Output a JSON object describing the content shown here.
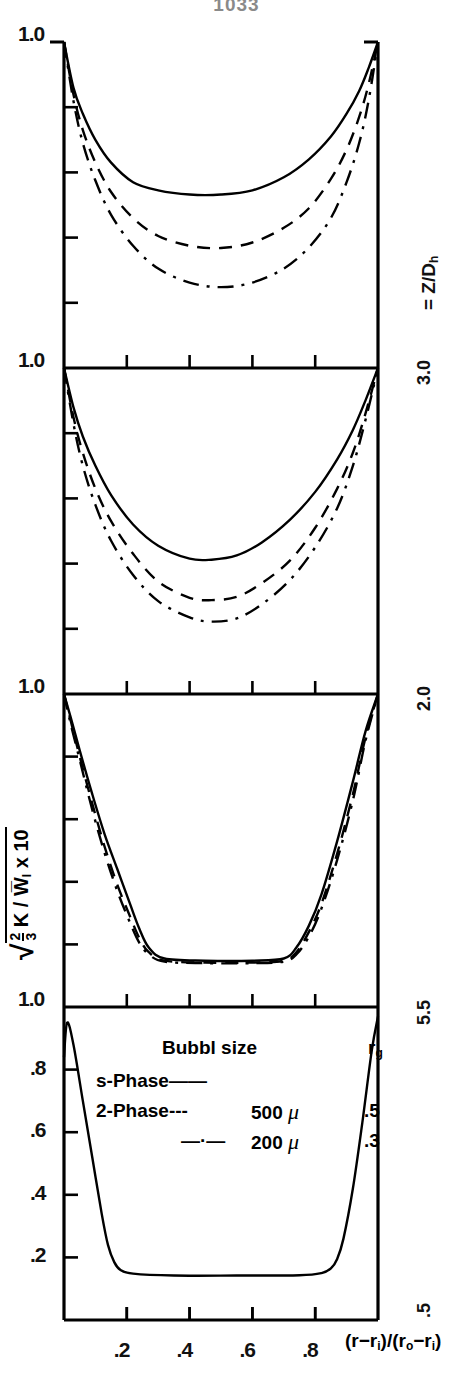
{
  "page_number": "1033",
  "axes": {
    "y_title_parts": {
      "radical": "√",
      "frac_num": "2",
      "frac_den": "3",
      "body": "K / W",
      "body_sub": "l",
      "tail": " x 10"
    },
    "y_title_plain": "√(2/3 K / W̄_l) x 10",
    "x_title": "(r−r_i)/(r_o−r_i)",
    "x_ticks": [
      ".2",
      ".4",
      ".6",
      ".8"
    ],
    "x_tick_values": [
      0.2,
      0.4,
      0.6,
      0.8
    ],
    "y_top_label": "1.0",
    "y_ticks_bottom_panel": [
      ".2",
      ".4",
      ".6",
      ".8",
      "1.0"
    ],
    "y_tick_values_bottom_panel": [
      0.2,
      0.4,
      0.6,
      0.8,
      1.0
    ],
    "xlim": [
      0,
      1
    ],
    "ylim": [
      0,
      1
    ],
    "grid": false
  },
  "panel_side_label": "= Z/D",
  "panel_side_label_sub": "h",
  "panels": [
    {
      "id": "panel-1",
      "z_over_dh": "3.0",
      "label": "3.0"
    },
    {
      "id": "panel-2",
      "z_over_dh": "2.0",
      "label": "2.0"
    },
    {
      "id": "panel-3",
      "z_over_dh": "5.5",
      "label": "5.5"
    },
    {
      "id": "panel-4",
      "z_over_dh": ".5",
      "label": ".5"
    }
  ],
  "legend": {
    "header_center": "Bubbl size",
    "header_right": "r",
    "header_right_sub": "g",
    "rows": [
      {
        "name": "s-Phase",
        "dash": "——",
        "size": "",
        "unit": "",
        "rg": "",
        "style": "solid"
      },
      {
        "name": "2-Phase",
        "dash": "---",
        "size": "500",
        "unit": "μ",
        "rg": ".5",
        "style": "dashed"
      },
      {
        "name": "",
        "dash": "—·—",
        "size": "200",
        "unit": "μ",
        "rg": ".3",
        "style": "dashdot"
      }
    ]
  },
  "chart_data": {
    "type": "line",
    "title": "",
    "xlabel": "(r−r_i)/(r_o−r_i)",
    "ylabel": "√(2/3 K / W̄_l) x 10",
    "xlim": [
      0,
      1
    ],
    "ylim": [
      0,
      1
    ],
    "grid": false,
    "legend_position": "inside-bottom-panel",
    "panels": [
      {
        "name": "Z/Dh = 3.0",
        "z_over_dh": 3.0,
        "series": [
          {
            "name": "s-Phase",
            "style": "solid",
            "x": [
              0.0,
              0.03,
              0.06,
              0.1,
              0.15,
              0.22,
              0.3,
              0.4,
              0.5,
              0.6,
              0.7,
              0.78,
              0.85,
              0.9,
              0.94,
              0.97,
              1.0
            ],
            "y": [
              1.0,
              0.86,
              0.78,
              0.7,
              0.63,
              0.57,
              0.545,
              0.532,
              0.532,
              0.545,
              0.585,
              0.64,
              0.71,
              0.78,
              0.85,
              0.92,
              1.0
            ]
          },
          {
            "name": "2-Phase 500 micron",
            "style": "dashed",
            "x": [
              0.0,
              0.03,
              0.06,
              0.1,
              0.15,
              0.22,
              0.3,
              0.4,
              0.5,
              0.6,
              0.7,
              0.78,
              0.85,
              0.9,
              0.94,
              0.97,
              1.0
            ],
            "y": [
              1.0,
              0.84,
              0.73,
              0.63,
              0.54,
              0.46,
              0.405,
              0.375,
              0.368,
              0.385,
              0.43,
              0.49,
              0.58,
              0.67,
              0.77,
              0.87,
              1.0
            ]
          },
          {
            "name": "200 micron",
            "style": "dashdot",
            "x": [
              0.0,
              0.03,
              0.06,
              0.1,
              0.15,
              0.22,
              0.3,
              0.4,
              0.5,
              0.6,
              0.7,
              0.78,
              0.85,
              0.9,
              0.94,
              0.97,
              1.0
            ],
            "y": [
              1.0,
              0.82,
              0.69,
              0.575,
              0.47,
              0.375,
              0.305,
              0.262,
              0.248,
              0.262,
              0.305,
              0.37,
              0.46,
              0.57,
              0.69,
              0.82,
              1.0
            ]
          }
        ]
      },
      {
        "name": "Z/Dh = 2.0",
        "z_over_dh": 2.0,
        "series": [
          {
            "name": "s-Phase",
            "style": "solid",
            "x": [
              0.0,
              0.03,
              0.06,
              0.1,
              0.15,
              0.22,
              0.3,
              0.4,
              0.47,
              0.55,
              0.63,
              0.72,
              0.8,
              0.87,
              0.92,
              0.96,
              1.0
            ],
            "y": [
              1.0,
              0.88,
              0.79,
              0.7,
              0.61,
              0.52,
              0.455,
              0.415,
              0.412,
              0.425,
              0.465,
              0.535,
              0.62,
              0.72,
              0.81,
              0.9,
              1.0
            ]
          },
          {
            "name": "2-Phase 500 micron",
            "style": "dashed",
            "x": [
              0.0,
              0.03,
              0.06,
              0.1,
              0.15,
              0.22,
              0.3,
              0.4,
              0.47,
              0.55,
              0.63,
              0.72,
              0.8,
              0.87,
              0.92,
              0.96,
              1.0
            ],
            "y": [
              1.0,
              0.85,
              0.74,
              0.63,
              0.53,
              0.43,
              0.345,
              0.295,
              0.288,
              0.298,
              0.34,
              0.41,
              0.51,
              0.63,
              0.74,
              0.86,
              1.0
            ]
          },
          {
            "name": "200 micron",
            "style": "dashdot",
            "x": [
              0.0,
              0.03,
              0.06,
              0.1,
              0.15,
              0.22,
              0.3,
              0.4,
              0.47,
              0.55,
              0.63,
              0.72,
              0.8,
              0.87,
              0.92,
              0.96,
              1.0
            ],
            "y": [
              1.0,
              0.83,
              0.7,
              0.58,
              0.47,
              0.365,
              0.285,
              0.235,
              0.222,
              0.232,
              0.275,
              0.35,
              0.45,
              0.57,
              0.7,
              0.84,
              1.0
            ]
          }
        ]
      },
      {
        "name": "Z/Dh = 5.5",
        "z_over_dh": 5.5,
        "series": [
          {
            "name": "s-Phase",
            "style": "solid",
            "x": [
              0.0,
              0.02,
              0.05,
              0.09,
              0.13,
              0.17,
              0.21,
              0.24,
              0.27,
              0.32,
              0.45,
              0.6,
              0.7,
              0.74,
              0.78,
              0.82,
              0.87,
              0.92,
              0.96,
              1.0
            ],
            "y": [
              1.0,
              0.93,
              0.82,
              0.68,
              0.55,
              0.44,
              0.33,
              0.25,
              0.19,
              0.155,
              0.148,
              0.148,
              0.155,
              0.19,
              0.26,
              0.36,
              0.53,
              0.72,
              0.88,
              1.0
            ]
          },
          {
            "name": "2-Phase 500 micron",
            "style": "dashed",
            "x": [
              0.0,
              0.02,
              0.05,
              0.09,
              0.13,
              0.17,
              0.21,
              0.24,
              0.27,
              0.32,
              0.45,
              0.6,
              0.7,
              0.74,
              0.78,
              0.82,
              0.87,
              0.92,
              0.96,
              1.0
            ],
            "y": [
              1.0,
              0.92,
              0.8,
              0.65,
              0.51,
              0.39,
              0.29,
              0.22,
              0.175,
              0.148,
              0.142,
              0.142,
              0.148,
              0.175,
              0.24,
              0.33,
              0.49,
              0.68,
              0.86,
              1.0
            ]
          },
          {
            "name": "200 micron",
            "style": "dashdot",
            "x": [
              0.0,
              0.02,
              0.05,
              0.09,
              0.13,
              0.17,
              0.21,
              0.24,
              0.27,
              0.32,
              0.45,
              0.6,
              0.7,
              0.74,
              0.78,
              0.82,
              0.87,
              0.92,
              0.96,
              1.0
            ],
            "y": [
              1.0,
              0.91,
              0.79,
              0.63,
              0.49,
              0.37,
              0.27,
              0.205,
              0.168,
              0.145,
              0.14,
              0.14,
              0.145,
              0.168,
              0.225,
              0.315,
              0.47,
              0.66,
              0.85,
              1.0
            ]
          }
        ]
      },
      {
        "name": "Z/Dh = 0.5",
        "z_over_dh": 0.5,
        "series": [
          {
            "name": "s-Phase",
            "style": "solid",
            "x": [
              0.0,
              0.01,
              0.03,
              0.06,
              0.09,
              0.12,
              0.14,
              0.16,
              0.18,
              0.22,
              0.35,
              0.55,
              0.75,
              0.82,
              0.85,
              0.87,
              0.89,
              0.92,
              0.95,
              0.98,
              1.0
            ],
            "y": [
              0.84,
              0.95,
              0.88,
              0.7,
              0.52,
              0.34,
              0.24,
              0.185,
              0.16,
              0.148,
              0.142,
              0.142,
              0.143,
              0.15,
              0.165,
              0.195,
              0.26,
              0.42,
              0.63,
              0.86,
              0.97
            ]
          }
        ]
      }
    ]
  }
}
